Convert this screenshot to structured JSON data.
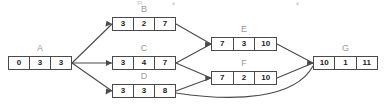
{
  "diagram": {
    "type": "activity-on-node-network",
    "title": "",
    "nodes": [
      {
        "id": "A",
        "label": "A",
        "cells": [
          "0",
          "3",
          "3"
        ],
        "x": 8,
        "y": 56,
        "width": 64,
        "height": 14
      },
      {
        "id": "B",
        "label": "B",
        "cells": [
          "3",
          "2",
          "7"
        ],
        "x": 112,
        "y": 17,
        "width": 64,
        "height": 14
      },
      {
        "id": "C",
        "label": "C",
        "cells": [
          "3",
          "4",
          "7"
        ],
        "x": 112,
        "y": 56,
        "width": 64,
        "height": 14
      },
      {
        "id": "D",
        "label": "D",
        "cells": [
          "3",
          "3",
          "8"
        ],
        "x": 112,
        "y": 84,
        "width": 64,
        "height": 14
      },
      {
        "id": "E",
        "label": "E",
        "cells": [
          "7",
          "3",
          "10"
        ],
        "x": 211,
        "y": 37,
        "width": 66,
        "height": 14
      },
      {
        "id": "F",
        "label": "F",
        "cells": [
          "7",
          "2",
          "10"
        ],
        "x": 211,
        "y": 71,
        "width": 66,
        "height": 14
      },
      {
        "id": "G",
        "label": "G",
        "cells": [
          "10",
          "1",
          "11"
        ],
        "x": 313,
        "y": 56,
        "width": 65,
        "height": 14
      }
    ],
    "edges": [
      {
        "from": "A",
        "to": "B",
        "style": "straight"
      },
      {
        "from": "A",
        "to": "C",
        "style": "straight"
      },
      {
        "from": "A",
        "to": "D",
        "style": "straight"
      },
      {
        "from": "B",
        "to": "E",
        "style": "straight"
      },
      {
        "from": "C",
        "to": "E",
        "style": "straight"
      },
      {
        "from": "C",
        "to": "F",
        "style": "straight"
      },
      {
        "from": "D",
        "to": "F",
        "style": "straight"
      },
      {
        "from": "E",
        "to": "G",
        "style": "straight"
      },
      {
        "from": "F",
        "to": "G",
        "style": "straight"
      },
      {
        "from": "D",
        "to": "G",
        "style": "curved"
      }
    ],
    "colors": {
      "background": "#ffffff",
      "box_border": "#4a4a4a",
      "cell_text": "#1d1d1d",
      "node_label": "#9a9a9a",
      "edge_line": "#4a4a4a",
      "artifact_text": "#cfcfcf"
    },
    "top_artifacts": [
      {
        "text": "B",
        "x": 137,
        "y": 0
      },
      {
        "text": "•",
        "x": 172,
        "y": 0
      },
      {
        "text": "•",
        "x": 296,
        "y": 0
      }
    ]
  }
}
